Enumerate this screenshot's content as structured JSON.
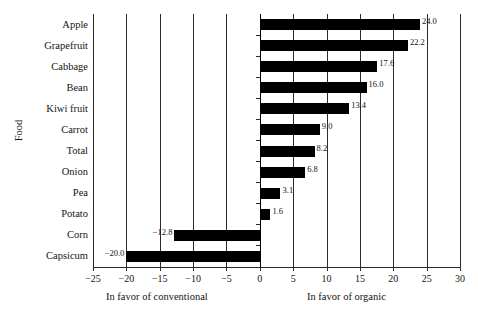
{
  "chart_data": {
    "type": "bar",
    "orientation": "horizontal",
    "title": "",
    "xlabel_left": "In favor of conventional",
    "xlabel_right": "In favor of organic",
    "ylabel": "Food",
    "categories": [
      "Apple",
      "Grapefruit",
      "Cabbage",
      "Bean",
      "Kiwi fruit",
      "Carrot",
      "Total",
      "Onion",
      "Pea",
      "Potato",
      "Corn",
      "Capsicum"
    ],
    "values": [
      24.0,
      22.2,
      17.6,
      16.0,
      13.4,
      9.0,
      8.2,
      6.8,
      3.1,
      1.6,
      -12.8,
      -20.0
    ],
    "data_labels": [
      "24.0",
      "22.2",
      "17.6",
      "16.0",
      "13.4",
      "9.0",
      "8.2",
      "6.8",
      "3.1",
      "1.6",
      "−12.8",
      "−20.0"
    ],
    "xlim": [
      -25,
      30
    ],
    "xticks": [
      -25,
      -20,
      -15,
      -10,
      -5,
      0,
      5,
      10,
      15,
      20,
      25,
      30
    ],
    "xticklabels": [
      "−25",
      "−20",
      "−15",
      "−10",
      "−5",
      "0",
      "5",
      "10",
      "15",
      "20",
      "25",
      "30"
    ],
    "grid": "vertical",
    "legend": "none",
    "bar_color": "#000000",
    "axis_color": "#2b2b2b",
    "background": "#ffffff"
  }
}
